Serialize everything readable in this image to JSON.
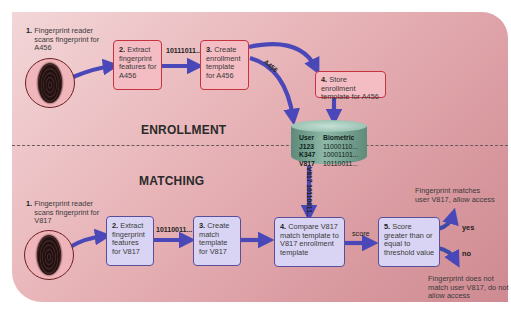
{
  "sections": {
    "enrollment": "ENROLLMENT",
    "matching": "MATCHING"
  },
  "enrollment": {
    "step1": {
      "num": "1.",
      "text": "Fingerprint reader scans fingerprint for A456"
    },
    "step2": {
      "num": "2.",
      "text": "Extract fingerprint features for A456"
    },
    "step3": {
      "num": "3.",
      "text": "Create enrollment template for A456"
    },
    "step4": {
      "num": "4.",
      "text": "Store enrollment template for A456"
    },
    "features_data": "10111011...",
    "user_id_label": "A456"
  },
  "matching": {
    "step1": {
      "num": "1.",
      "text": "Fingerprint reader scans fingerprint for V817"
    },
    "step2": {
      "num": "2.",
      "text": "Extract fingerprint features for V817"
    },
    "step3": {
      "num": "3.",
      "text": "Create match template for V817"
    },
    "step4": {
      "num": "4.",
      "text": "Compare V817 match template to V817 enrollment template"
    },
    "step5": {
      "num": "5.",
      "text": "Score greater than or equal to threshold value"
    },
    "features_data": "10110011...",
    "retrieved_label": "V817 10110011...",
    "score_label": "score",
    "yes_label": "yes",
    "no_label": "no",
    "yes_outcome": "Fingerprint matches user V817, allow access",
    "no_outcome": "Fingerprint does not match user V817, do not allow access"
  },
  "database": {
    "headers": [
      "User",
      "Biometric"
    ],
    "rows": [
      [
        "J123",
        "11000110..."
      ],
      [
        "K347",
        "10001101..."
      ],
      [
        "V817",
        "10110011..."
      ]
    ]
  },
  "colors": {
    "panel": "#e0a6ab",
    "enroll_box_fill": "#f4bcc3",
    "enroll_box_border": "#c8323e",
    "match_box_fill": "#d9d4f3",
    "match_box_border": "#5a4d9a",
    "arrow": "#4a48b8",
    "database": "#7aa898"
  }
}
